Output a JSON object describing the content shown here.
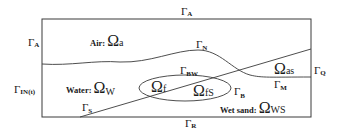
{
  "diagram": {
    "colors": {
      "stroke": "#3a3a3a",
      "text": "#1a1a1a",
      "background": "#ffffff"
    },
    "boundaries": {
      "top": {
        "symbol": "Γ",
        "sub": "A"
      },
      "left_top": {
        "symbol": "Γ",
        "sub": "A"
      },
      "left_bottom": {
        "symbol": "Γ",
        "sub": "IN(t)"
      },
      "right": {
        "symbol": "Γ",
        "sub": "Q"
      },
      "bottom": {
        "symbol": "Γ",
        "sub": "R"
      },
      "interface_n": {
        "symbol": "Γ",
        "sub": "N"
      },
      "interface_bw": {
        "symbol": "Γ",
        "sub": "BW"
      },
      "interface_b": {
        "symbol": "Γ",
        "sub": "B"
      },
      "interface_m": {
        "symbol": "Γ",
        "sub": "M"
      },
      "interface_s": {
        "symbol": "Γ",
        "sub": "S"
      }
    },
    "regions": {
      "air": {
        "name": "Air",
        "sep": ":",
        "symbol": "Ω",
        "sub": "a"
      },
      "water": {
        "name": "Water",
        "sep": ":",
        "symbol": "Ω",
        "sub": "W"
      },
      "wet_sand": {
        "name": "Wet sand",
        "sep": ":",
        "symbol": "Ω",
        "sub": "WS"
      },
      "fish": {
        "symbol": "Ω",
        "sub": "f"
      },
      "fish_sand": {
        "symbol": "Ω",
        "sub": "fS"
      },
      "air_sand": {
        "symbol": "Ω",
        "sub": "as"
      }
    }
  }
}
